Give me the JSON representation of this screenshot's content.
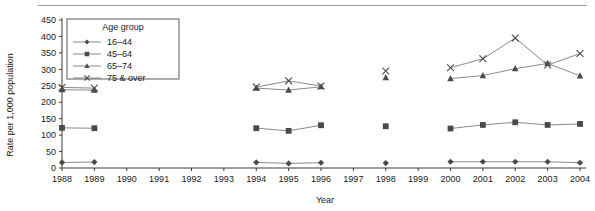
{
  "chart_data": {
    "type": "line",
    "title": "",
    "xlabel": "Year",
    "ylabel": "Rate per 1,000 population",
    "legend_title": "Age group",
    "legend_position": "top-left-inside",
    "grid": false,
    "x": [
      1988,
      1989,
      1990,
      1991,
      1992,
      1993,
      1994,
      1995,
      1996,
      1997,
      1998,
      1999,
      2000,
      2001,
      2002,
      2003,
      2004
    ],
    "xtick_labels": [
      "1988",
      "1989",
      "1990",
      "1991",
      "1992",
      "1993",
      "1994",
      "1995",
      "1996",
      "1997",
      "1998",
      "1999",
      "2000",
      "2001",
      "2002",
      "2003",
      "2004"
    ],
    "ytick_labels": [
      "0",
      "50",
      "100",
      "150",
      "200",
      "250",
      "300",
      "350",
      "400",
      "450"
    ],
    "yticks": [
      0,
      50,
      100,
      150,
      200,
      250,
      300,
      350,
      400,
      450
    ],
    "ylim": [
      0,
      450
    ],
    "xlim": [
      1988,
      2004
    ],
    "series": [
      {
        "name": "16–44",
        "marker": "diamond",
        "values": [
          17,
          18,
          null,
          null,
          null,
          null,
          17,
          14,
          16,
          null,
          15,
          null,
          19,
          19,
          19,
          19,
          16
        ]
      },
      {
        "name": "45–64",
        "marker": "square",
        "values": [
          122,
          121,
          null,
          null,
          null,
          null,
          121,
          113,
          130,
          null,
          127,
          null,
          120,
          131,
          139,
          131,
          134
        ]
      },
      {
        "name": "65–74",
        "marker": "triangle",
        "values": [
          238,
          237,
          null,
          null,
          null,
          null,
          243,
          237,
          247,
          null,
          275,
          null,
          272,
          281,
          302,
          318,
          280
        ]
      },
      {
        "name": "75 & over",
        "marker": "cross",
        "values": [
          245,
          243,
          null,
          null,
          null,
          null,
          246,
          265,
          249,
          null,
          295,
          null,
          305,
          332,
          395,
          313,
          348
        ]
      }
    ]
  }
}
